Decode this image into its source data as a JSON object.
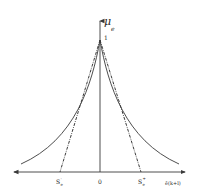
{
  "diagram": {
    "y_axis_label": "μ",
    "y_axis_sub": "e",
    "peak_label": "1",
    "origin_label": "0",
    "left_point_label": "S",
    "left_point_sup": "-",
    "left_point_sub": "e",
    "right_point_label": "S",
    "right_point_sup": "+",
    "right_point_sub": "e",
    "x_axis_label": "ê(k+l)",
    "colors": {
      "line": "#3a3a3a",
      "background": "#ffffff"
    }
  }
}
